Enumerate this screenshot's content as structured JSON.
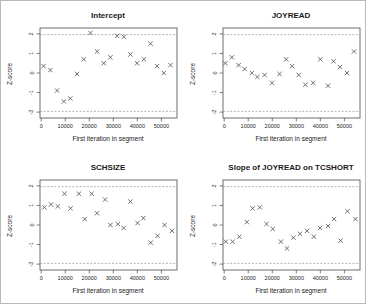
{
  "figure": {
    "marker_glyph": "x",
    "colors": {
      "marker": "#5f5f5f",
      "reference_line": "#949494",
      "frame": "#4a4a4a",
      "text": "#1a1a1a",
      "background": "#ffffff"
    }
  },
  "axes": {
    "x_label": "First iteration in segment",
    "y_label": "Z-score",
    "x_ticks": [
      0,
      10000,
      20000,
      30000,
      40000,
      50000
    ],
    "y_ticks": [
      -2,
      -1,
      0,
      1,
      2
    ],
    "xlim": [
      -500,
      56500
    ],
    "ylim": [
      -2.3,
      2.3
    ],
    "reference_lines": [
      1.96,
      -1.96
    ],
    "reference_style": "dashed"
  },
  "chart_data": [
    {
      "type": "scatter",
      "title": "Intercept",
      "xlabel": "First iteration in segment",
      "ylabel": "Z-score",
      "xlim": [
        -500,
        56500
      ],
      "ylim": [
        -2.3,
        2.3
      ],
      "reference_lines": [
        1.96,
        -1.96
      ],
      "x": [
        1000,
        3800,
        6600,
        9400,
        12100,
        14900,
        17700,
        20500,
        23300,
        26000,
        28800,
        31600,
        34400,
        37100,
        39900,
        42700,
        45500,
        48200,
        51000,
        53800
      ],
      "y": [
        0.35,
        0.15,
        -0.9,
        -1.45,
        -1.3,
        -0.05,
        0.7,
        2.05,
        1.1,
        0.5,
        0.8,
        1.9,
        1.85,
        0.95,
        0.5,
        0.7,
        1.5,
        0.35,
        0.0,
        0.4
      ]
    },
    {
      "type": "scatter",
      "title": "JOYREAD",
      "xlabel": "First iteration in segment",
      "ylabel": "Z-score",
      "xlim": [
        -500,
        56500
      ],
      "ylim": [
        -2.3,
        2.3
      ],
      "reference_lines": [
        1.96,
        -1.96
      ],
      "x": [
        500,
        3200,
        6000,
        8500,
        11500,
        13800,
        16800,
        19900,
        23000,
        25800,
        28300,
        31000,
        33800,
        37000,
        40000,
        43200,
        45500,
        48100,
        51100,
        54000
      ],
      "y": [
        0.5,
        0.8,
        0.4,
        0.2,
        0.0,
        -0.2,
        -0.1,
        -0.5,
        -0.05,
        0.7,
        0.35,
        -0.1,
        -0.6,
        -0.5,
        0.7,
        -0.65,
        0.6,
        0.3,
        0.0,
        1.1
      ]
    },
    {
      "type": "scatter",
      "title": "SCHSIZE",
      "xlabel": "First iteration in segment",
      "ylabel": "Z-score",
      "xlim": [
        -500,
        56500
      ],
      "ylim": [
        -2.3,
        2.3
      ],
      "reference_lines": [
        1.96,
        -1.96
      ],
      "x": [
        1300,
        4100,
        6900,
        9700,
        12200,
        15700,
        18100,
        21000,
        23200,
        26600,
        28800,
        31900,
        34300,
        37100,
        40100,
        42500,
        45600,
        48400,
        51300,
        54400
      ],
      "y": [
        0.9,
        1.05,
        0.95,
        1.6,
        0.85,
        1.6,
        0.3,
        1.6,
        0.6,
        1.3,
        0.0,
        0.05,
        -0.15,
        1.2,
        0.1,
        0.35,
        -0.9,
        -0.55,
        0.0,
        -0.3
      ]
    },
    {
      "type": "scatter",
      "title": "Slope of JOYREAD on TCSHORT",
      "xlabel": "First iteration in segment",
      "ylabel": "Z-score",
      "xlim": [
        -500,
        56500
      ],
      "ylim": [
        -2.3,
        2.3
      ],
      "reference_lines": [
        1.96,
        -1.96
      ],
      "x": [
        700,
        3500,
        6300,
        9400,
        11800,
        14800,
        17600,
        20200,
        23600,
        26100,
        28800,
        31500,
        34500,
        37300,
        39900,
        43200,
        45700,
        48400,
        51300,
        54600
      ],
      "y": [
        -0.85,
        -0.85,
        -0.6,
        0.15,
        0.85,
        0.9,
        0.05,
        -0.2,
        -0.85,
        -1.2,
        -0.65,
        -0.45,
        -0.3,
        -0.6,
        -0.15,
        -0.05,
        0.3,
        -0.8,
        0.7,
        0.3
      ]
    }
  ]
}
